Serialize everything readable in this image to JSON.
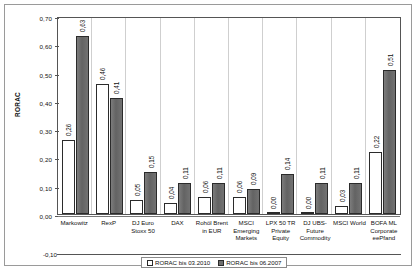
{
  "chart_data": {
    "type": "bar",
    "title": "",
    "xlabel": "",
    "ylabel": "RORAC",
    "ylim": [
      -0.1,
      0.7
    ],
    "yticks": [
      "0,70",
      "0,60",
      "0,50",
      "0,40",
      "0,30",
      "0,20",
      "0,10",
      "0,00",
      "-0,10"
    ],
    "ytick_values": [
      0.7,
      0.6,
      0.5,
      0.4,
      0.3,
      0.2,
      0.1,
      0.0,
      -0.1
    ],
    "grid": false,
    "legend_position": "bottom",
    "categories": [
      "Markowitz",
      "RexP",
      "DJ Euro Stoxx 50",
      "DAX",
      "Rohöl Brent in EUR",
      "MSCI Emerging Markets",
      "LPX 50 TR Private Equity",
      "DJ UBS-Future Commodity",
      "MSCI World",
      "BOFA ML Corporate eePfand"
    ],
    "category_lines": [
      [
        "Markowitz"
      ],
      [
        "RexP"
      ],
      [
        "DJ Euro",
        "Stoxx 50"
      ],
      [
        "DAX"
      ],
      [
        "Rohöl Brent",
        "in EUR"
      ],
      [
        "MSCI",
        "Emerging",
        "Markets"
      ],
      [
        "LPX 50 TR",
        "Private Equity"
      ],
      [
        "DJ UBS-",
        "Future",
        "Commodity"
      ],
      [
        "MSCI World"
      ],
      [
        "BOFA ML",
        "Corporate",
        "eePfand"
      ]
    ],
    "series": [
      {
        "name": "RORAC bis 03.2010",
        "color": "#ffffff",
        "values": [
          0.26,
          0.46,
          0.05,
          0.04,
          0.06,
          0.06,
          0.0,
          0.0,
          0.03,
          0.22
        ],
        "labels": [
          "0,26",
          "0,46",
          "0,05",
          "0,04",
          "0,06",
          "0,06",
          "0,00",
          "0,00",
          "0,03",
          "0,22"
        ]
      },
      {
        "name": "RORAC bis 06.2007",
        "color": "#6e6e6e",
        "values": [
          0.63,
          0.41,
          0.15,
          0.11,
          0.11,
          0.09,
          0.14,
          0.11,
          0.11,
          0.51
        ],
        "labels": [
          "0,63",
          "0,41",
          "0,15",
          "0,11",
          "0,11",
          "0,09",
          "0,14",
          "0,11",
          "0,11",
          "0,51"
        ]
      }
    ]
  }
}
